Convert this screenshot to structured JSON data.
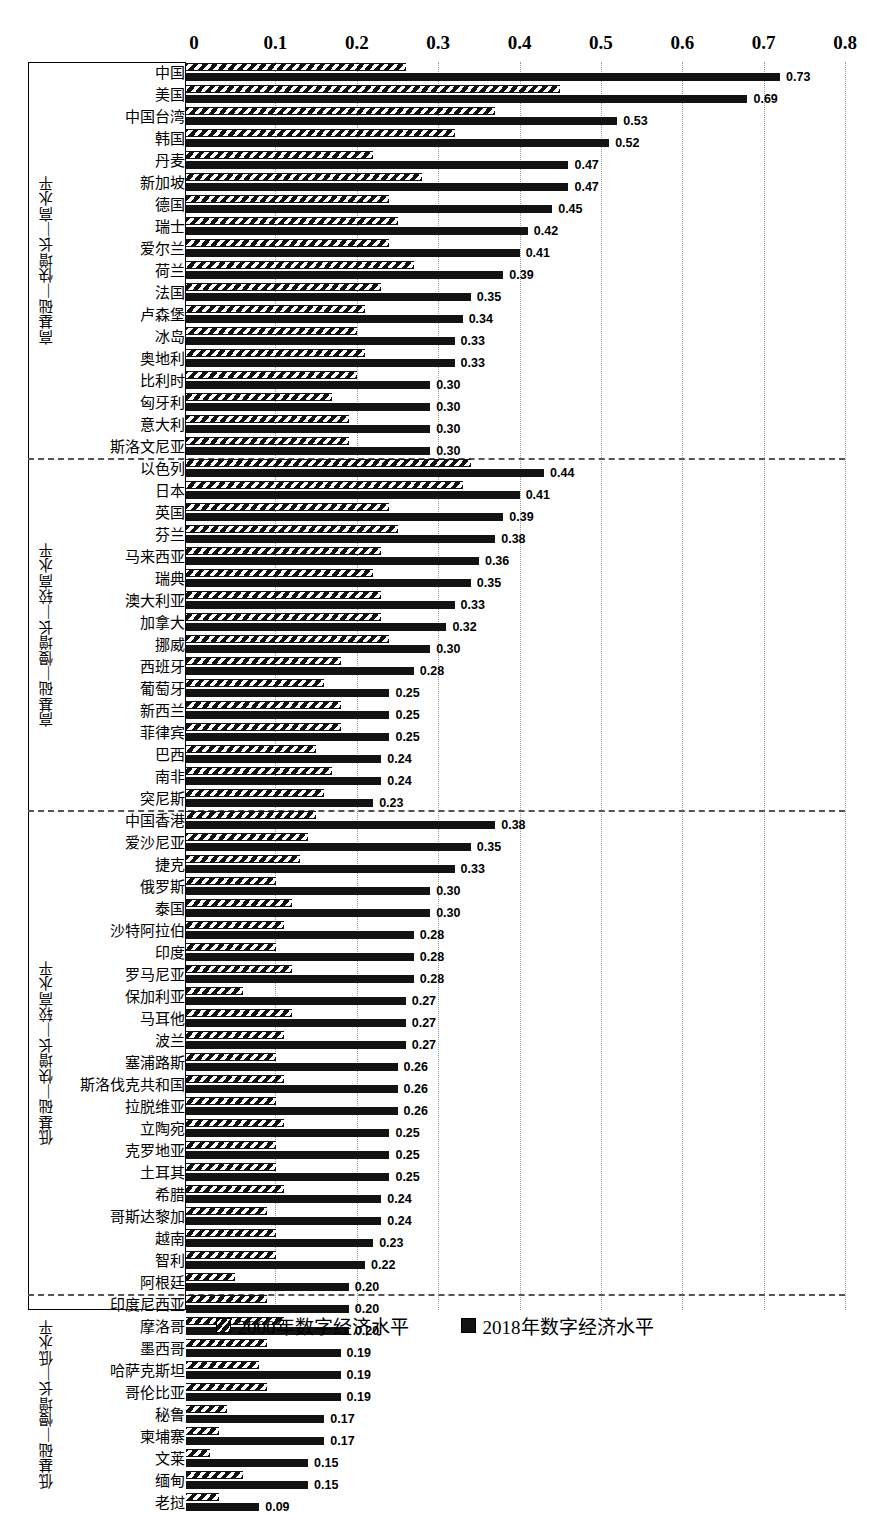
{
  "chart_data": {
    "type": "bar",
    "title": "",
    "xlabel": "",
    "ylabel": "",
    "orientation": "horizontal",
    "xlim": [
      0,
      0.8
    ],
    "xticks": [
      "0",
      "0.1",
      "0.2",
      "0.3",
      "0.4",
      "0.5",
      "0.6",
      "0.7",
      "0.8"
    ],
    "xtick_values": [
      0,
      0.1,
      0.2,
      0.3,
      0.4,
      0.5,
      0.6,
      0.7,
      0.8
    ],
    "grid": "vertical-dotted",
    "legend_position": "bottom-center",
    "series": [
      {
        "name": "2000年数字经济水平",
        "pattern": "hatched"
      },
      {
        "name": "2018年数字经济水平",
        "pattern": "solid"
      }
    ],
    "groups": [
      {
        "label": "高基础—快增长—高水平",
        "rows": [
          {
            "category": "中国",
            "v2000": 0.27,
            "v2018": 0.73,
            "label": "0.73"
          },
          {
            "category": "美国",
            "v2000": 0.46,
            "v2018": 0.69,
            "label": "0.69"
          },
          {
            "category": "中国台湾",
            "v2000": 0.38,
            "v2018": 0.53,
            "label": "0.53"
          },
          {
            "category": "韩国",
            "v2000": 0.33,
            "v2018": 0.52,
            "label": "0.52"
          },
          {
            "category": "丹麦",
            "v2000": 0.23,
            "v2018": 0.47,
            "label": "0.47"
          },
          {
            "category": "新加坡",
            "v2000": 0.29,
            "v2018": 0.47,
            "label": "0.47"
          },
          {
            "category": "德国",
            "v2000": 0.25,
            "v2018": 0.45,
            "label": "0.45"
          },
          {
            "category": "瑞士",
            "v2000": 0.26,
            "v2018": 0.42,
            "label": "0.42"
          },
          {
            "category": "爱尔兰",
            "v2000": 0.25,
            "v2018": 0.41,
            "label": "0.41"
          },
          {
            "category": "荷兰",
            "v2000": 0.28,
            "v2018": 0.39,
            "label": "0.39"
          },
          {
            "category": "法国",
            "v2000": 0.24,
            "v2018": 0.35,
            "label": "0.35"
          },
          {
            "category": "卢森堡",
            "v2000": 0.22,
            "v2018": 0.34,
            "label": "0.34"
          },
          {
            "category": "冰岛",
            "v2000": 0.21,
            "v2018": 0.33,
            "label": "0.33"
          },
          {
            "category": "奥地利",
            "v2000": 0.22,
            "v2018": 0.33,
            "label": "0.33"
          },
          {
            "category": "比利时",
            "v2000": 0.21,
            "v2018": 0.3,
            "label": "0.30"
          },
          {
            "category": "匈牙利",
            "v2000": 0.18,
            "v2018": 0.3,
            "label": "0.30"
          },
          {
            "category": "意大利",
            "v2000": 0.2,
            "v2018": 0.3,
            "label": "0.30"
          },
          {
            "category": "斯洛文尼亚",
            "v2000": 0.2,
            "v2018": 0.3,
            "label": "0.30"
          }
        ]
      },
      {
        "label": "高基础—慢增长—较高水平",
        "rows": [
          {
            "category": "以色列",
            "v2000": 0.35,
            "v2018": 0.44,
            "label": "0.44"
          },
          {
            "category": "日本",
            "v2000": 0.34,
            "v2018": 0.41,
            "label": "0.41"
          },
          {
            "category": "英国",
            "v2000": 0.25,
            "v2018": 0.39,
            "label": "0.39"
          },
          {
            "category": "芬兰",
            "v2000": 0.26,
            "v2018": 0.38,
            "label": "0.38"
          },
          {
            "category": "马来西亚",
            "v2000": 0.24,
            "v2018": 0.36,
            "label": "0.36"
          },
          {
            "category": "瑞典",
            "v2000": 0.23,
            "v2018": 0.35,
            "label": "0.35"
          },
          {
            "category": "澳大利亚",
            "v2000": 0.24,
            "v2018": 0.33,
            "label": "0.33"
          },
          {
            "category": "加拿大",
            "v2000": 0.24,
            "v2018": 0.32,
            "label": "0.32"
          },
          {
            "category": "挪威",
            "v2000": 0.25,
            "v2018": 0.3,
            "label": "0.30"
          },
          {
            "category": "西班牙",
            "v2000": 0.19,
            "v2018": 0.28,
            "label": "0.28"
          },
          {
            "category": "葡萄牙",
            "v2000": 0.17,
            "v2018": 0.25,
            "label": "0.25"
          },
          {
            "category": "新西兰",
            "v2000": 0.19,
            "v2018": 0.25,
            "label": "0.25"
          },
          {
            "category": "菲律宾",
            "v2000": 0.19,
            "v2018": 0.25,
            "label": "0.25"
          },
          {
            "category": "巴西",
            "v2000": 0.16,
            "v2018": 0.24,
            "label": "0.24"
          },
          {
            "category": "南非",
            "v2000": 0.18,
            "v2018": 0.24,
            "label": "0.24"
          },
          {
            "category": "突尼斯",
            "v2000": 0.17,
            "v2018": 0.23,
            "label": "0.23"
          }
        ]
      },
      {
        "label": "低基础—快增长—较高水平",
        "rows": [
          {
            "category": "中国香港",
            "v2000": 0.16,
            "v2018": 0.38,
            "label": "0.38"
          },
          {
            "category": "爱沙尼亚",
            "v2000": 0.15,
            "v2018": 0.35,
            "label": "0.35"
          },
          {
            "category": "捷克",
            "v2000": 0.14,
            "v2018": 0.33,
            "label": "0.33"
          },
          {
            "category": "俄罗斯",
            "v2000": 0.11,
            "v2018": 0.3,
            "label": "0.30"
          },
          {
            "category": "泰国",
            "v2000": 0.13,
            "v2018": 0.3,
            "label": "0.30"
          },
          {
            "category": "沙特阿拉伯",
            "v2000": 0.12,
            "v2018": 0.28,
            "label": "0.28"
          },
          {
            "category": "印度",
            "v2000": 0.11,
            "v2018": 0.28,
            "label": "0.28"
          },
          {
            "category": "罗马尼亚",
            "v2000": 0.13,
            "v2018": 0.28,
            "label": "0.28"
          },
          {
            "category": "保加利亚",
            "v2000": 0.07,
            "v2018": 0.27,
            "label": "0.27"
          },
          {
            "category": "马耳他",
            "v2000": 0.13,
            "v2018": 0.27,
            "label": "0.27"
          },
          {
            "category": "波兰",
            "v2000": 0.12,
            "v2018": 0.27,
            "label": "0.27"
          },
          {
            "category": "塞浦路斯",
            "v2000": 0.11,
            "v2018": 0.26,
            "label": "0.26"
          },
          {
            "category": "斯洛伐克共和国",
            "v2000": 0.12,
            "v2018": 0.26,
            "label": "0.26"
          },
          {
            "category": "拉脱维亚",
            "v2000": 0.11,
            "v2018": 0.26,
            "label": "0.26"
          },
          {
            "category": "立陶宛",
            "v2000": 0.12,
            "v2018": 0.25,
            "label": "0.25"
          },
          {
            "category": "克罗地亚",
            "v2000": 0.11,
            "v2018": 0.25,
            "label": "0.25"
          },
          {
            "category": "土耳其",
            "v2000": 0.11,
            "v2018": 0.25,
            "label": "0.25"
          },
          {
            "category": "希腊",
            "v2000": 0.12,
            "v2018": 0.24,
            "label": "0.24"
          },
          {
            "category": "哥斯达黎加",
            "v2000": 0.1,
            "v2018": 0.24,
            "label": "0.24"
          },
          {
            "category": "越南",
            "v2000": 0.11,
            "v2018": 0.23,
            "label": "0.23"
          },
          {
            "category": "智利",
            "v2000": 0.11,
            "v2018": 0.22,
            "label": "0.22"
          },
          {
            "category": "阿根廷",
            "v2000": 0.06,
            "v2018": 0.2,
            "label": "0.20"
          }
        ]
      },
      {
        "label": "低基础—慢增长—低水平",
        "rows": [
          {
            "category": "印度尼西亚",
            "v2000": 0.1,
            "v2018": 0.2,
            "label": "0.20"
          },
          {
            "category": "摩洛哥",
            "v2000": 0.12,
            "v2018": 0.2,
            "label": "0.20"
          },
          {
            "category": "墨西哥",
            "v2000": 0.1,
            "v2018": 0.19,
            "label": "0.19"
          },
          {
            "category": "哈萨克斯坦",
            "v2000": 0.09,
            "v2018": 0.19,
            "label": "0.19"
          },
          {
            "category": "哥伦比亚",
            "v2000": 0.1,
            "v2018": 0.19,
            "label": "0.19"
          },
          {
            "category": "秘鲁",
            "v2000": 0.05,
            "v2018": 0.17,
            "label": "0.17"
          },
          {
            "category": "柬埔寨",
            "v2000": 0.04,
            "v2018": 0.17,
            "label": "0.17"
          },
          {
            "category": "文莱",
            "v2000": 0.03,
            "v2018": 0.15,
            "label": "0.15"
          },
          {
            "category": "缅甸",
            "v2000": 0.07,
            "v2018": 0.15,
            "label": "0.15"
          },
          {
            "category": "老挝",
            "v2000": 0.04,
            "v2018": 0.09,
            "label": "0.09"
          }
        ]
      }
    ]
  }
}
